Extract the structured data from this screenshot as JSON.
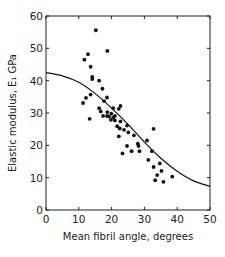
{
  "chart_data": {
    "type": "scatter",
    "title": "",
    "xlabel": "Mean fibril angle, degrees",
    "ylabel": "Elastic modulus, E₁ GPa",
    "xlim": [
      0,
      50
    ],
    "ylim": [
      0,
      60
    ],
    "xticks": [
      0,
      10,
      20,
      30,
      40,
      50
    ],
    "yticks": [
      0,
      10,
      20,
      30,
      40,
      50,
      60
    ],
    "grid": false,
    "legend": null,
    "series": [
      {
        "name": "Measured data",
        "type": "scatter",
        "marker": "filled-circle",
        "color": "#111111",
        "points": [
          [
            15.2,
            55.6
          ],
          [
            18.7,
            49.2
          ],
          [
            12.8,
            48.2
          ],
          [
            11.7,
            46.5
          ],
          [
            13.6,
            44.3
          ],
          [
            14.1,
            41.2
          ],
          [
            14.1,
            40.5
          ],
          [
            16.2,
            40.0
          ],
          [
            17.2,
            37.5
          ],
          [
            13.6,
            35.7
          ],
          [
            18.6,
            34.8
          ],
          [
            12.2,
            34.7
          ],
          [
            17.7,
            33.7
          ],
          [
            11.3,
            33.1
          ],
          [
            16.2,
            31.5
          ],
          [
            22.7,
            32.2
          ],
          [
            22.2,
            31.3
          ],
          [
            20.5,
            31.5
          ],
          [
            16.7,
            30.5
          ],
          [
            18.7,
            30.3
          ],
          [
            19.9,
            29.8
          ],
          [
            21.0,
            29.1
          ],
          [
            17.4,
            29.1
          ],
          [
            19.2,
            28.9
          ],
          [
            20.5,
            28.6
          ],
          [
            18.6,
            29.1
          ],
          [
            13.3,
            28.2
          ],
          [
            19.8,
            27.9
          ],
          [
            21.0,
            27.7
          ],
          [
            22.7,
            27.4
          ],
          [
            21.7,
            25.9
          ],
          [
            24.7,
            26.1
          ],
          [
            22.5,
            25.2
          ],
          [
            23.8,
            24.8
          ],
          [
            25.1,
            24.0
          ],
          [
            26.8,
            23.1
          ],
          [
            22.2,
            22.8
          ],
          [
            30.8,
            21.5
          ],
          [
            32.8,
            25.1
          ],
          [
            28.0,
            20.5
          ],
          [
            28.2,
            19.8
          ],
          [
            24.7,
            19.8
          ],
          [
            28.5,
            18.2
          ],
          [
            26.1,
            18.2
          ],
          [
            32.3,
            18.2
          ],
          [
            23.3,
            17.5
          ],
          [
            31.2,
            15.5
          ],
          [
            34.7,
            14.4
          ],
          [
            32.8,
            13.3
          ],
          [
            35.2,
            12.1
          ],
          [
            33.9,
            10.8
          ],
          [
            38.5,
            10.3
          ],
          [
            33.3,
            9.2
          ],
          [
            35.8,
            8.7
          ]
        ]
      },
      {
        "name": "Fitted curve",
        "type": "line",
        "color": "#111111",
        "x": [
          0,
          5,
          10,
          15,
          20,
          25,
          30,
          35,
          40,
          45,
          50
        ],
        "y": [
          42.5,
          41.5,
          39.5,
          36.0,
          31.5,
          26.5,
          21.0,
          16.0,
          12.0,
          9.0,
          7.3
        ]
      }
    ]
  }
}
